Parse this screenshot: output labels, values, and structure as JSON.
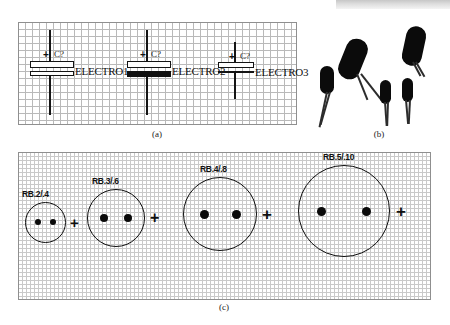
{
  "figure": {
    "panels": [
      {
        "id": "a",
        "caption": "(a)",
        "description": "electrolytic capacitor schematic symbols on grid"
      },
      {
        "id": "b",
        "caption": "(b)",
        "description": "photographs of radial electrolytic capacitors"
      },
      {
        "id": "c",
        "caption": "(c)",
        "description": "pad/footprint outlines on fine grid"
      }
    ]
  },
  "panel_a": {
    "symbols": [
      {
        "ref": "C?",
        "name": "ELECTRO1",
        "polarity": "+",
        "plate_style": "open-open"
      },
      {
        "ref": "C?",
        "name": "ELECTRO2",
        "polarity": "+",
        "plate_style": "open-solid"
      },
      {
        "ref": "C?",
        "name": "ELECTRO3",
        "polarity": "+",
        "plate_style": "line-line"
      }
    ]
  },
  "panel_b": {
    "components": [
      {
        "index": 1,
        "size": "small"
      },
      {
        "index": 2,
        "size": "large"
      },
      {
        "index": 3,
        "size": "small"
      },
      {
        "index": 4,
        "size": "small"
      },
      {
        "index": 5,
        "size": "large"
      }
    ]
  },
  "panel_c": {
    "footprints": [
      {
        "label": "RB.2/.4",
        "pad_count": 2
      },
      {
        "label": "RB.3/.6",
        "pad_count": 2
      },
      {
        "label": "RB.4/.8",
        "pad_count": 2
      },
      {
        "label": "RB.5/.10",
        "pad_count": 2
      }
    ],
    "separator": "+",
    "trailing_separator": "+"
  },
  "colors": {
    "ink": "#111111",
    "grid": "#b9b9b9",
    "grid_fine": "#c9c9c9",
    "panel_border": "#8f8f8f",
    "paper": "#ffffff"
  }
}
